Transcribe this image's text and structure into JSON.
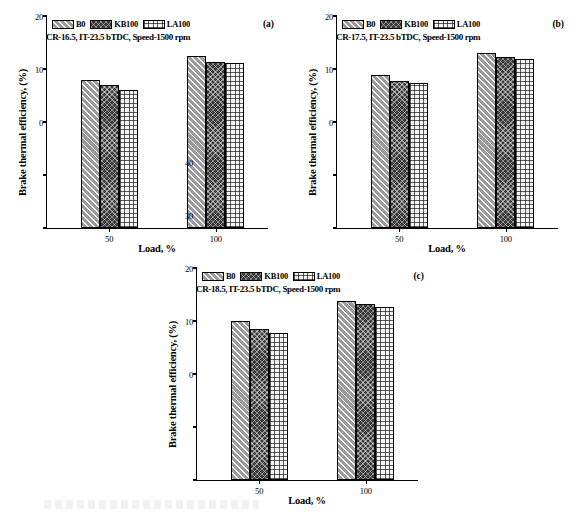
{
  "figure": {
    "series_names": [
      "B0",
      "KB100",
      "LA100"
    ],
    "y_axis_label": "Brake thermal efficiency, (%)",
    "x_axis_label": "Load, %",
    "y_ticks": [
      "0",
      "10",
      "20",
      "30",
      "40"
    ],
    "x_ticks": [
      "50",
      "100"
    ],
    "colors": {
      "b0": "#9a9a9a",
      "kb100": "#3a3a3a",
      "la100": "#f2f2f2"
    }
  },
  "chart_data": [
    {
      "type": "bar",
      "panel": "(a)",
      "title": "CR-16.5, IT-23.5 bTDC, Speed-1500 rpm",
      "categories": [
        "50",
        "100"
      ],
      "series": [
        {
          "name": "B0",
          "values": [
            27.8,
            32.3
          ]
        },
        {
          "name": "KB100",
          "values": [
            26.8,
            31.1
          ]
        },
        {
          "name": "LA100",
          "values": [
            26.0,
            30.9
          ]
        }
      ],
      "xlabel": "Load, %",
      "ylabel": "Brake thermal efficiency, (%)",
      "ylim": [
        0,
        40
      ],
      "yticks": [
        0,
        10,
        20,
        30,
        40
      ],
      "grid": false,
      "legend_position": "top-left"
    },
    {
      "type": "bar",
      "panel": "(b)",
      "title": "CR-17.5, IT-23.5 bTDC, Speed-1500 rpm",
      "categories": [
        "50",
        "100"
      ],
      "series": [
        {
          "name": "B0",
          "values": [
            28.7,
            32.8
          ]
        },
        {
          "name": "KB100",
          "values": [
            27.6,
            32.1
          ]
        },
        {
          "name": "LA100",
          "values": [
            27.3,
            31.8
          ]
        }
      ],
      "xlabel": "Load, %",
      "ylabel": "Brake thermal efficiency, (%)",
      "ylim": [
        0,
        40
      ],
      "yticks": [
        0,
        10,
        20,
        30,
        40
      ],
      "grid": false,
      "legend_position": "top-left"
    },
    {
      "type": "bar",
      "panel": "(c)",
      "title": "CR-18.5, IT-23.5 bTDC, Speed-1500 rpm",
      "categories": [
        "50",
        "100"
      ],
      "series": [
        {
          "name": "B0",
          "values": [
            29.8,
            33.7
          ]
        },
        {
          "name": "KB100",
          "values": [
            28.4,
            33.0
          ]
        },
        {
          "name": "LA100",
          "values": [
            27.7,
            32.5
          ]
        }
      ],
      "xlabel": "Load, %",
      "ylabel": "Brake thermal efficiency, (%)",
      "ylim": [
        0,
        40
      ],
      "yticks": [
        0,
        10,
        20,
        30,
        40
      ],
      "grid": false,
      "legend_position": "top-left"
    }
  ]
}
